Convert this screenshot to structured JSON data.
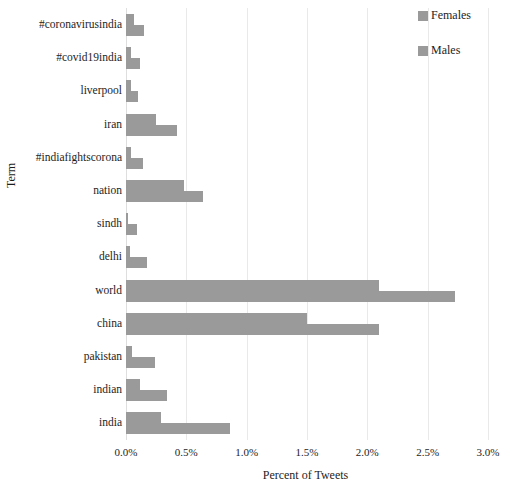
{
  "chart_data": {
    "type": "bar",
    "orientation": "horizontal",
    "title": "",
    "xlabel": "Percent of Tweets",
    "ylabel": "Term",
    "xlim": [
      0.0,
      3.0
    ],
    "xticks": [
      "0.0%",
      "0.5%",
      "1.0%",
      "1.5%",
      "2.0%",
      "2.5%",
      "3.0%"
    ],
    "xtick_values": [
      0.0,
      0.5,
      1.0,
      1.5,
      2.0,
      2.5,
      3.0
    ],
    "grid": "vertical",
    "legend_position": "top-right",
    "categories": [
      "#coronavirusindia",
      "#covid19india",
      "liverpool",
      "iran",
      "#indiafightscorona",
      "nation",
      "sindh",
      "delhi",
      "world",
      "china",
      "pakistan",
      "indian",
      "india"
    ],
    "series": [
      {
        "name": "Females",
        "color": "#9a9a9a",
        "values": [
          0.07,
          0.04,
          0.04,
          0.25,
          0.04,
          0.48,
          0.01,
          0.03,
          2.1,
          1.5,
          0.05,
          0.12,
          0.29
        ]
      },
      {
        "name": "Males",
        "color": "#9a9a9a",
        "values": [
          0.15,
          0.12,
          0.1,
          0.42,
          0.14,
          0.64,
          0.09,
          0.17,
          2.73,
          2.1,
          0.24,
          0.34,
          0.86
        ]
      }
    ]
  },
  "legend": {
    "items": [
      {
        "label": "Females",
        "color": "#9a9a9a"
      },
      {
        "label": "Males",
        "color": "#9a9a9a"
      }
    ]
  },
  "axes": {
    "x_title": "Percent of Tweets",
    "y_title": "Term"
  }
}
